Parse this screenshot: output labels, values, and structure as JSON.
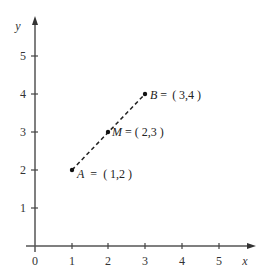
{
  "diagram": {
    "type": "coordinate-plane",
    "axes": {
      "x_label": "x",
      "y_label": "y",
      "origin_label": "0",
      "x_ticks": [
        "1",
        "2",
        "3",
        "4",
        "5"
      ],
      "y_ticks": [
        "1",
        "2",
        "3",
        "4",
        "5"
      ],
      "color": "#555555"
    },
    "points": [
      {
        "name": "A",
        "coords": "( 1,2 )",
        "x": 1,
        "y": 2,
        "label": "A = ( 1,2 )"
      },
      {
        "name": "M",
        "coords": "( 2,3 )",
        "x": 2,
        "y": 3,
        "label": "M = ( 2,3 )"
      },
      {
        "name": "B",
        "coords": "( 3,4 )",
        "x": 3,
        "y": 4,
        "label": "B = ( 3,4 )"
      }
    ],
    "segment": {
      "from": "A",
      "to": "B",
      "style": "dashed",
      "color": "#222222"
    }
  }
}
